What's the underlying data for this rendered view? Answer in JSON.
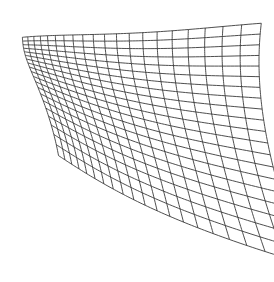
{
  "figure": {
    "type": "deformed-grid",
    "width": 274,
    "height": 282,
    "background_color": "#ffffff"
  },
  "grid": {
    "columns": 20,
    "rows": 20,
    "vertical_line_count": 21,
    "horizontal_line_count": 21,
    "line_color": "#3a3a3a",
    "line_width": 0.9,
    "sample_steps": 90,
    "bounds": {
      "left": 14,
      "top": 9,
      "right": 259,
      "bottom": 268
    }
  },
  "distortion": {
    "model": "radial-pinch",
    "description": "Grid compressed and curved toward the left edge; nearly rectangular on the right.",
    "center_x": -0.62,
    "center_y": 0.18,
    "strength": 0.92,
    "falloff": 1.45,
    "shear_top": 0.055,
    "shear_bottom": -0.012,
    "edge_power": 1.9,
    "horizontal_bow": 0.085,
    "vertical_bow": 0.035
  },
  "chart_data": {
    "type": "mesh",
    "xlabel": "",
    "ylabel": "",
    "grid": true,
    "legend": "none",
    "columns": 20,
    "rows": 20,
    "xlim": [
      0,
      1
    ],
    "ylim": [
      0,
      1
    ],
    "series": [
      {
        "name": "vertical-lines",
        "values": [
          0,
          1,
          2,
          3,
          4,
          5,
          6,
          7,
          8,
          9,
          10,
          11,
          12,
          13,
          14,
          15,
          16,
          17,
          18,
          19,
          20
        ]
      },
      {
        "name": "horizontal-lines",
        "values": [
          0,
          1,
          2,
          3,
          4,
          5,
          6,
          7,
          8,
          9,
          10,
          11,
          12,
          13,
          14,
          15,
          16,
          17,
          18,
          19,
          20
        ]
      }
    ],
    "annotations": []
  }
}
